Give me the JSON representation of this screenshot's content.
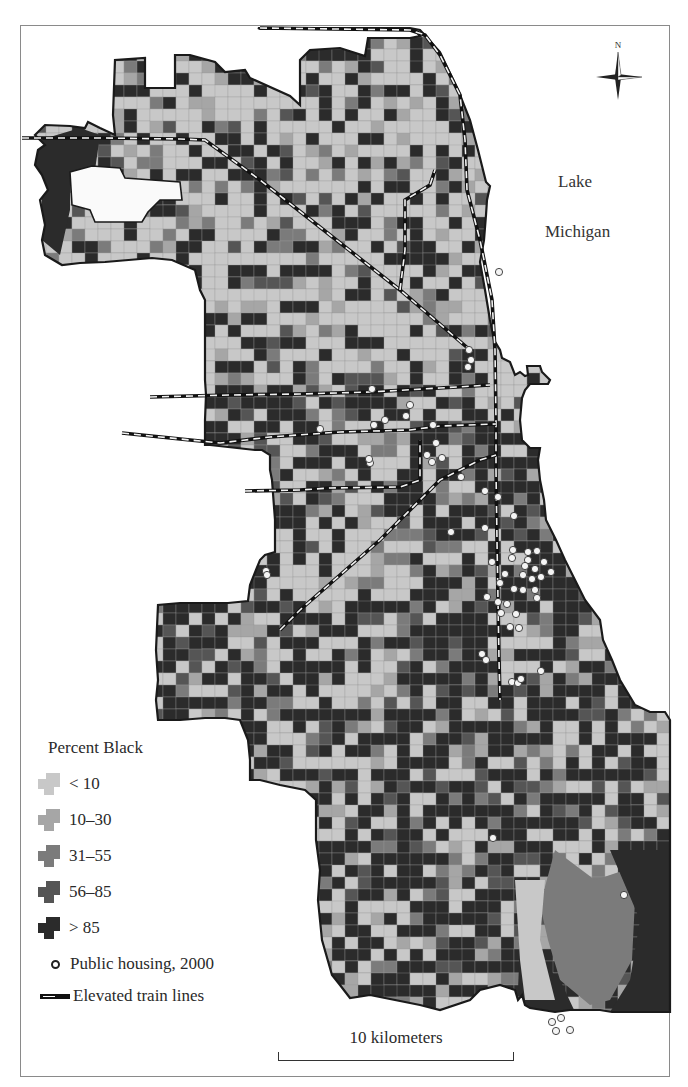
{
  "map": {
    "lake_label_line1": "Lake",
    "lake_label_line2": "Michigan",
    "compass_label": "N",
    "scale_label": "10 kilometers"
  },
  "legend": {
    "title": "Percent Black",
    "categories": [
      {
        "label": "< 10",
        "color": "#c8c8c8"
      },
      {
        "label": "10–30",
        "color": "#a6a6a6"
      },
      {
        "label": "31–55",
        "color": "#7b7b7b"
      },
      {
        "label": "56–85",
        "color": "#555555"
      },
      {
        "label": "> 85",
        "color": "#2b2b2b"
      }
    ],
    "public_housing_label": "Public housing, 2000",
    "train_label": "Elevated train lines"
  },
  "colors": {
    "tract_lt10": "#c8c8c8",
    "tract_10_30": "#a6a6a6",
    "tract_31_55": "#7b7b7b",
    "tract_56_85": "#555555",
    "tract_gt85": "#2b2b2b",
    "boundary": "#1a1a1a",
    "housing_fill": "#f4f4f4",
    "housing_stroke": "#333333",
    "water": "#ffffff"
  },
  "public_housing_points": [
    [
      499,
      272
    ],
    [
      469,
      350
    ],
    [
      471,
      360
    ],
    [
      468,
      367
    ],
    [
      372,
      389
    ],
    [
      320,
      429
    ],
    [
      374,
      425
    ],
    [
      385,
      420
    ],
    [
      406,
      416
    ],
    [
      410,
      405
    ],
    [
      433,
      425
    ],
    [
      436,
      443
    ],
    [
      427,
      455
    ],
    [
      432,
      462
    ],
    [
      442,
      458
    ],
    [
      370,
      463
    ],
    [
      369,
      459
    ],
    [
      485,
      491
    ],
    [
      498,
      497
    ],
    [
      461,
      477
    ],
    [
      514,
      516
    ],
    [
      451,
      532
    ],
    [
      485,
      528
    ],
    [
      513,
      550
    ],
    [
      528,
      552
    ],
    [
      537,
      551
    ],
    [
      528,
      560
    ],
    [
      544,
      562
    ],
    [
      525,
      566
    ],
    [
      535,
      569
    ],
    [
      551,
      572
    ],
    [
      492,
      562
    ],
    [
      512,
      558
    ],
    [
      523,
      575
    ],
    [
      532,
      579
    ],
    [
      541,
      577
    ],
    [
      535,
      590
    ],
    [
      505,
      574
    ],
    [
      500,
      583
    ],
    [
      514,
      589
    ],
    [
      523,
      590
    ],
    [
      498,
      602
    ],
    [
      507,
      604
    ],
    [
      501,
      613
    ],
    [
      487,
      597
    ],
    [
      516,
      614
    ],
    [
      510,
      627
    ],
    [
      519,
      628
    ],
    [
      537,
      598
    ],
    [
      482,
      654
    ],
    [
      486,
      660
    ],
    [
      512,
      682
    ],
    [
      518,
      683
    ],
    [
      521,
      679
    ],
    [
      541,
      671
    ],
    [
      266,
      571
    ],
    [
      267,
      575
    ],
    [
      493,
      838
    ],
    [
      624,
      895
    ],
    [
      552,
      1022
    ],
    [
      561,
      1018
    ],
    [
      556,
      1031
    ],
    [
      570,
      1030
    ]
  ],
  "train_lines": [
    [
      [
        260,
        28
      ],
      [
        410,
        30
      ],
      [
        425,
        35
      ],
      [
        440,
        55
      ],
      [
        460,
        95
      ],
      [
        465,
        140
      ],
      [
        467,
        190
      ],
      [
        480,
        240
      ],
      [
        492,
        300
      ],
      [
        495,
        350
      ],
      [
        496,
        420
      ],
      [
        496,
        470
      ]
    ],
    [
      [
        22,
        138
      ],
      [
        100,
        138
      ],
      [
        180,
        139
      ],
      [
        205,
        140
      ],
      [
        260,
        180
      ],
      [
        330,
        235
      ],
      [
        400,
        290
      ],
      [
        470,
        350
      ]
    ],
    [
      [
        150,
        397
      ],
      [
        230,
        395
      ],
      [
        300,
        394
      ],
      [
        370,
        392
      ],
      [
        440,
        388
      ],
      [
        490,
        385
      ]
    ],
    [
      [
        122,
        433
      ],
      [
        190,
        440
      ],
      [
        220,
        443
      ],
      [
        270,
        437
      ],
      [
        340,
        432
      ],
      [
        410,
        430
      ],
      [
        440,
        426
      ],
      [
        496,
        424
      ]
    ],
    [
      [
        245,
        491
      ],
      [
        300,
        490
      ],
      [
        330,
        488
      ],
      [
        400,
        487
      ],
      [
        420,
        480
      ],
      [
        420,
        440
      ]
    ],
    [
      [
        280,
        630
      ],
      [
        300,
        610
      ],
      [
        380,
        540
      ],
      [
        440,
        480
      ],
      [
        480,
        460
      ],
      [
        496,
        455
      ]
    ],
    [
      [
        496,
        470
      ],
      [
        497,
        540
      ],
      [
        498,
        600
      ],
      [
        499,
        660
      ],
      [
        500,
        700
      ]
    ],
    [
      [
        400,
        290
      ],
      [
        405,
        250
      ],
      [
        405,
        200
      ],
      [
        430,
        185
      ],
      [
        435,
        170
      ]
    ]
  ]
}
